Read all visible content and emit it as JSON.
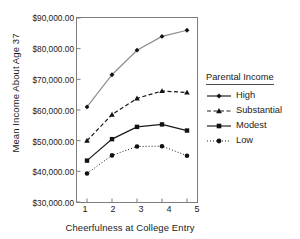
{
  "chart_data": {
    "type": "line",
    "title": "",
    "xlabel": "Cheerfulness at College Entry",
    "ylabel": "Mean Income About Age 37",
    "x": [
      1,
      2,
      3,
      4,
      5
    ],
    "categories": [
      "1",
      "2",
      "3",
      "4",
      "5"
    ],
    "xlim": [
      0.6,
      5.4
    ],
    "ylim": [
      30000,
      90000
    ],
    "ytick_values": [
      30000,
      40000,
      50000,
      60000,
      70000,
      80000,
      90000
    ],
    "ytick_labels": [
      "$30,000.00",
      "$40,000.00",
      "$50,000.00",
      "$60,000.00",
      "$70,000.00",
      "$80,000.00",
      "$90,000.00"
    ],
    "grid": false,
    "legend_position": "right",
    "legend_title": "Parental Income",
    "series": [
      {
        "name": "High",
        "values": [
          61000,
          71500,
          79500,
          84000,
          86000
        ],
        "marker": "diamond",
        "linestyle": "solid",
        "color": "#8c8c8c"
      },
      {
        "name": "Substantial",
        "values": [
          50000,
          58500,
          63800,
          66200,
          65700
        ],
        "marker": "triangle",
        "linestyle": "dashed",
        "color": "#1a1a1a"
      },
      {
        "name": "Modest",
        "values": [
          43500,
          50500,
          54500,
          55300,
          53300
        ],
        "marker": "square",
        "linestyle": "solid",
        "color": "#1a1a1a"
      },
      {
        "name": "Low",
        "values": [
          39300,
          45200,
          48100,
          48200,
          45100
        ],
        "marker": "circle",
        "linestyle": "dotted",
        "color": "#1a1a1a"
      }
    ]
  },
  "colors": {
    "axis": "#7d7d7d",
    "text": "#1a1a1a",
    "background": "#ffffff"
  }
}
